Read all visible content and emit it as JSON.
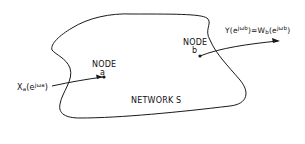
{
  "diagram": {
    "network_label": "NETWORK S",
    "node_a": {
      "title": "NODE",
      "name": "a"
    },
    "node_b": {
      "title": "NODE",
      "name": "b"
    },
    "input_signal": {
      "base": "X",
      "sub": "a",
      "open": "(e",
      "exp": "jω",
      "exp_sub": "a",
      "close": ")"
    },
    "output_signal": {
      "lhs": "Y(e",
      "lhs_exp": "jω",
      "lhs_exp_sub": "b",
      "mid": ")=W",
      "mid_sub": "b",
      "rhs": "(e",
      "rhs_exp": "jω",
      "rhs_exp_sub": "b",
      "close": ")"
    },
    "colors": {
      "stroke": "#1a1a1a",
      "background": "#ffffff"
    }
  }
}
